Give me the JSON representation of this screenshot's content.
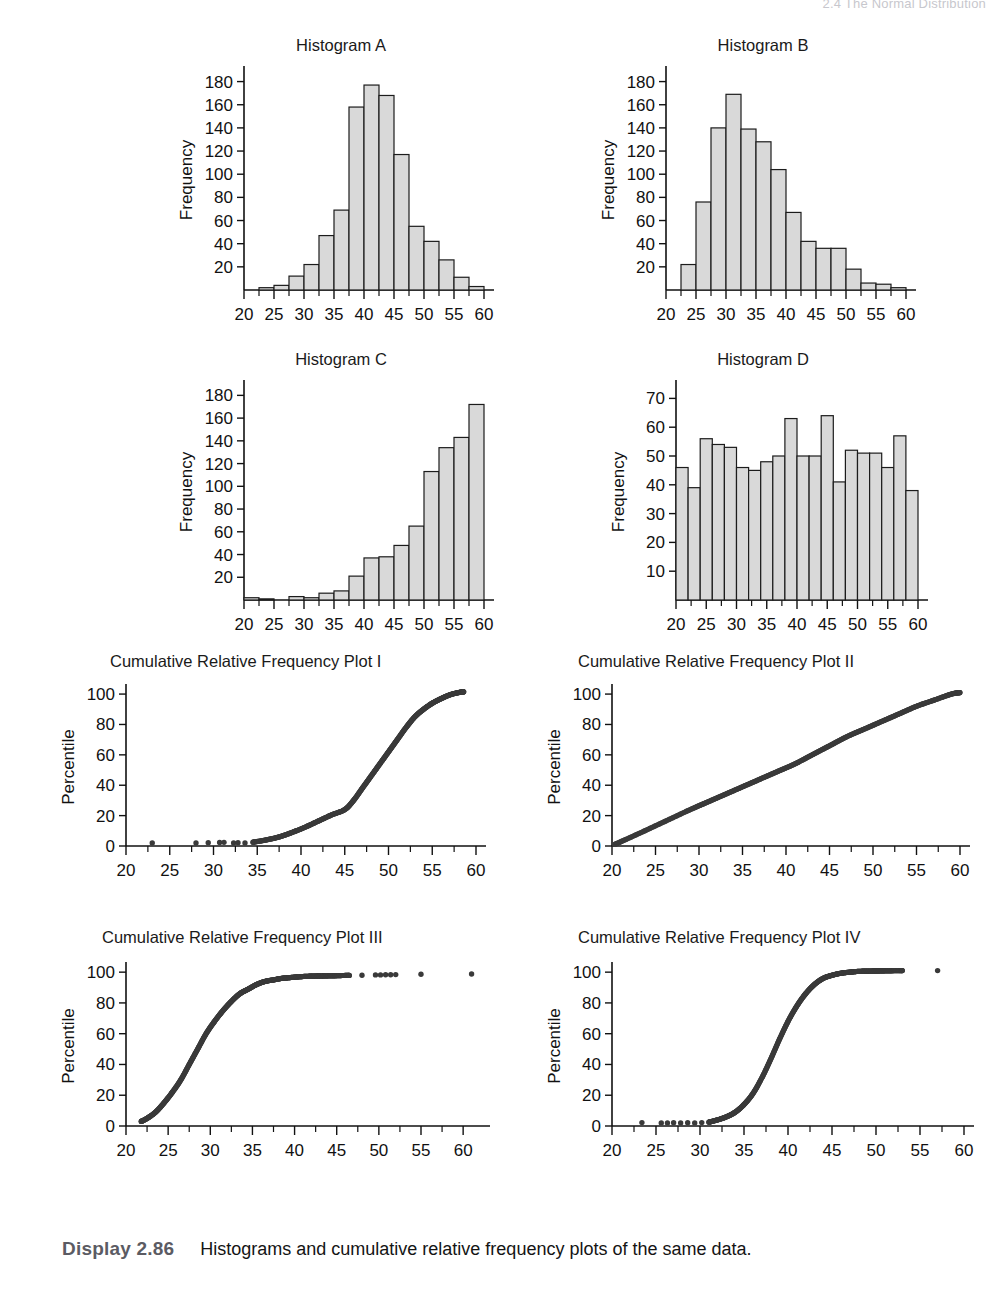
{
  "running_head": "2.4 The Normal Distribution",
  "caption": {
    "display_label": "Display 2.86",
    "text": "Histograms and cumulative relative frequency plots of the same data."
  },
  "panels": [
    {
      "id": "hist-a",
      "title": "Histogram A"
    },
    {
      "id": "hist-b",
      "title": "Histogram B"
    },
    {
      "id": "hist-c",
      "title": "Histogram C"
    },
    {
      "id": "hist-d",
      "title": "Histogram D"
    },
    {
      "id": "crf-i",
      "title": "Cumulative Relative Frequency Plot I"
    },
    {
      "id": "crf-ii",
      "title": "Cumulative Relative Frequency Plot II"
    },
    {
      "id": "crf-iii",
      "title": "Cumulative Relative Frequency Plot III"
    },
    {
      "id": "crf-iv",
      "title": "Cumulative Relative Frequency Plot IV"
    }
  ],
  "axis_titles": {
    "frequency": "Frequency",
    "percentile": "Percentile"
  },
  "chart_data": [
    {
      "id": "hist-a",
      "type": "bar",
      "title": "Histogram A",
      "xlabel": "",
      "ylabel": "Frequency",
      "xlim": [
        20,
        60
      ],
      "ylim": [
        0,
        190
      ],
      "xticks": [
        20,
        25,
        30,
        35,
        40,
        45,
        50,
        55,
        60
      ],
      "xtick_labels": [
        "20",
        "25",
        "30",
        "35",
        "40",
        "45",
        "50",
        "55",
        "60"
      ],
      "minor_xtick_step": 2.5,
      "yticks": [
        20,
        40,
        60,
        80,
        100,
        120,
        140,
        160,
        180
      ],
      "ytick_labels": [
        "20",
        "40",
        "60",
        "80",
        "100",
        "120",
        "140",
        "160",
        "180"
      ],
      "grid": false,
      "bin_width": 2.5,
      "bin_starts": [
        20.0,
        22.5,
        25.0,
        27.5,
        30.0,
        32.5,
        35.0,
        37.5,
        40.0,
        42.5,
        45.0,
        47.5,
        50.0,
        52.5,
        55.0,
        57.5
      ],
      "values": [
        0,
        2,
        4,
        12,
        22,
        47,
        69,
        158,
        177,
        168,
        117,
        55,
        42,
        26,
        11,
        3
      ]
    },
    {
      "id": "hist-b",
      "type": "bar",
      "title": "Histogram B",
      "xlabel": "",
      "ylabel": "Frequency",
      "xlim": [
        20,
        60
      ],
      "ylim": [
        0,
        190
      ],
      "xticks": [
        20,
        25,
        30,
        35,
        40,
        45,
        50,
        55,
        60
      ],
      "xtick_labels": [
        "20",
        "25",
        "30",
        "35",
        "40",
        "45",
        "50",
        "55",
        "60"
      ],
      "minor_xtick_step": 2.5,
      "yticks": [
        20,
        40,
        60,
        80,
        100,
        120,
        140,
        160,
        180
      ],
      "ytick_labels": [
        "20",
        "40",
        "60",
        "80",
        "100",
        "120",
        "140",
        "160",
        "180"
      ],
      "grid": false,
      "bin_width": 2.5,
      "bin_starts": [
        20.0,
        22.5,
        25.0,
        27.5,
        30.0,
        32.5,
        35.0,
        37.5,
        40.0,
        42.5,
        45.0,
        47.5,
        50.0,
        52.5,
        55.0,
        57.5
      ],
      "values": [
        0,
        22,
        76,
        140,
        169,
        139,
        128,
        104,
        67,
        42,
        36,
        36,
        18,
        6,
        5,
        2
      ]
    },
    {
      "id": "hist-c",
      "type": "bar",
      "title": "Histogram C",
      "xlabel": "",
      "ylabel": "Frequency",
      "xlim": [
        20,
        60
      ],
      "ylim": [
        0,
        190
      ],
      "xticks": [
        20,
        25,
        30,
        35,
        40,
        45,
        50,
        55,
        60
      ],
      "xtick_labels": [
        "20",
        "25",
        "30",
        "35",
        "40",
        "45",
        "50",
        "55",
        "60"
      ],
      "minor_xtick_step": 2.5,
      "yticks": [
        20,
        40,
        60,
        80,
        100,
        120,
        140,
        160,
        180
      ],
      "ytick_labels": [
        "20",
        "40",
        "60",
        "80",
        "100",
        "120",
        "140",
        "160",
        "180"
      ],
      "grid": false,
      "bin_width": 2.5,
      "bin_starts": [
        20.0,
        22.5,
        25.0,
        27.5,
        30.0,
        32.5,
        35.0,
        37.5,
        40.0,
        42.5,
        45.0,
        47.5,
        50.0,
        52.5,
        55.0,
        57.5
      ],
      "values": [
        2,
        1,
        0,
        3,
        2,
        6,
        8,
        21,
        37,
        38,
        48,
        65,
        113,
        134,
        143,
        172
      ]
    },
    {
      "id": "hist-d",
      "type": "bar",
      "title": "Histogram D",
      "xlabel": "",
      "ylabel": "Frequency",
      "xlim": [
        20,
        60
      ],
      "ylim": [
        0,
        75
      ],
      "xticks": [
        20,
        25,
        30,
        35,
        40,
        45,
        50,
        55,
        60
      ],
      "xtick_labels": [
        "20",
        "25",
        "30",
        "35",
        "40",
        "45",
        "50",
        "55",
        "60"
      ],
      "minor_xtick_step": 2.5,
      "yticks": [
        10,
        20,
        30,
        40,
        50,
        60,
        70
      ],
      "ytick_labels": [
        "10",
        "20",
        "30",
        "40",
        "50",
        "60",
        "70"
      ],
      "grid": false,
      "bin_width": 2.0,
      "bin_starts": [
        20,
        22,
        24,
        26,
        28,
        30,
        32,
        34,
        36,
        38,
        40,
        42,
        44,
        46,
        48,
        50,
        52,
        54,
        56,
        58
      ],
      "values": [
        46,
        39,
        56,
        54,
        53,
        46,
        45,
        48,
        50,
        63,
        50,
        50,
        64,
        41,
        52,
        51,
        51,
        46,
        57,
        38
      ]
    },
    {
      "id": "crf-i",
      "type": "scatter",
      "title": "Cumulative Relative Frequency Plot I",
      "xlabel": "",
      "ylabel": "Percentile",
      "xlim": [
        20,
        60
      ],
      "ylim": [
        0,
        104
      ],
      "xticks": [
        20,
        25,
        30,
        35,
        40,
        45,
        50,
        55,
        60
      ],
      "xtick_labels": [
        "20",
        "25",
        "30",
        "35",
        "40",
        "45",
        "50",
        "55",
        "60"
      ],
      "minor_xtick_step": 2.5,
      "yticks": [
        0,
        20,
        40,
        60,
        80,
        100
      ],
      "ytick_labels": [
        "0",
        "20",
        "40",
        "60",
        "80",
        "100"
      ],
      "grid": false,
      "shape": "ogive-left-skewed",
      "note": "Matches Histogram C (left-skewed): isolated low-percentile points near 23, 28, 30, 31-33, then rise from ~35 to 100 near 58.",
      "outlier_x": [
        23.0,
        28.0,
        29.4,
        30.7,
        31.2,
        32.3,
        32.8,
        33.6
      ],
      "outlier_y": [
        2.0,
        2.0,
        2.2,
        2.3,
        2.4,
        2.0,
        2.2,
        2.0
      ],
      "curve_x": [
        34.5,
        36,
        37.5,
        39,
        40.5,
        42,
        43.5,
        45,
        46,
        47,
        48,
        49,
        50,
        51,
        52,
        53,
        54,
        55,
        56,
        57,
        58,
        58.6
      ],
      "curve_y": [
        2.5,
        4,
        6,
        9,
        12.5,
        16.5,
        20.5,
        24,
        30,
        38,
        46,
        54,
        62,
        70,
        78,
        85,
        90,
        94,
        97,
        99.5,
        101,
        101.5
      ]
    },
    {
      "id": "crf-ii",
      "type": "scatter",
      "title": "Cumulative Relative Frequency Plot II",
      "xlabel": "",
      "ylabel": "Percentile",
      "xlim": [
        20,
        60
      ],
      "ylim": [
        0,
        104
      ],
      "xticks": [
        20,
        25,
        30,
        35,
        40,
        45,
        50,
        55,
        60
      ],
      "xtick_labels": [
        "20",
        "25",
        "30",
        "35",
        "40",
        "45",
        "50",
        "55",
        "60"
      ],
      "minor_xtick_step": 2.5,
      "yticks": [
        0,
        20,
        40,
        60,
        80,
        100
      ],
      "ytick_labels": [
        "0",
        "20",
        "40",
        "60",
        "80",
        "100"
      ],
      "grid": false,
      "shape": "linear",
      "note": "Matches Histogram D (uniform): nearly straight line from (20.3, 1) to (60, 101).",
      "curve_x": [
        20.3,
        23,
        26,
        29,
        31,
        33,
        35,
        37,
        39,
        41,
        43,
        45,
        47,
        49,
        51,
        53,
        55,
        57,
        59,
        60
      ],
      "curve_y": [
        1,
        8,
        16,
        24,
        29,
        34,
        39,
        44,
        49,
        54,
        60,
        66,
        72,
        77,
        82,
        87,
        92,
        96,
        100,
        101
      ]
    },
    {
      "id": "crf-iii",
      "type": "scatter",
      "title": "Cumulative Relative Frequency Plot III",
      "xlabel": "",
      "ylabel": "Percentile",
      "xlim": [
        20,
        62
      ],
      "ylim": [
        0,
        104
      ],
      "xticks": [
        20,
        25,
        30,
        35,
        40,
        45,
        50,
        55,
        60
      ],
      "xtick_labels": [
        "20",
        "25",
        "30",
        "35",
        "40",
        "45",
        "50",
        "55",
        "60"
      ],
      "minor_xtick_step": 2.5,
      "yticks": [
        0,
        20,
        40,
        60,
        80,
        100
      ],
      "ytick_labels": [
        "0",
        "20",
        "40",
        "60",
        "80",
        "100"
      ],
      "grid": false,
      "shape": "ogive-right-skewed",
      "note": "Matches Histogram B (right-skewed): rapid rise from ~22 to ~40, plateau near 97-99, scattered high-end points out to 61.",
      "curve_x": [
        21.8,
        22.5,
        23.5,
        24.5,
        25.5,
        26.5,
        27.5,
        28.5,
        29.5,
        30.5,
        31.5,
        32.5,
        33.5,
        34.5,
        35.5,
        36.5,
        37.5,
        38.5,
        39.5,
        40.5,
        41.5,
        42.5,
        43.5,
        44.5,
        45.5,
        46.5
      ],
      "curve_y": [
        3,
        5,
        9,
        15,
        22,
        30,
        40,
        50,
        60,
        68,
        75,
        81,
        86,
        89,
        92,
        94,
        95,
        96,
        96.5,
        97,
        97.3,
        97.5,
        97.6,
        97.7,
        97.8,
        97.9
      ],
      "outlier_x": [
        48.0,
        49.6,
        50.2,
        50.8,
        51.4,
        52.0,
        55.0,
        61.0
      ],
      "outlier_y": [
        98.0,
        98.2,
        98.2,
        98.3,
        98.3,
        98.4,
        98.6,
        98.8
      ]
    },
    {
      "id": "crf-iv",
      "type": "scatter",
      "title": "Cumulative Relative Frequency Plot IV",
      "xlabel": "",
      "ylabel": "Percentile",
      "xlim": [
        20,
        60
      ],
      "ylim": [
        0,
        104
      ],
      "xticks": [
        20,
        25,
        30,
        35,
        40,
        45,
        50,
        55,
        60
      ],
      "xtick_labels": [
        "20",
        "25",
        "30",
        "35",
        "40",
        "45",
        "50",
        "55",
        "60"
      ],
      "minor_xtick_step": 2.5,
      "yticks": [
        0,
        20,
        40,
        60,
        80,
        100
      ],
      "ytick_labels": [
        "0",
        "20",
        "40",
        "60",
        "80",
        "100"
      ],
      "grid": false,
      "shape": "ogive-symmetric",
      "note": "Matches Histogram A (symmetric): low points near 23-30, S-rise centered ~40, plateau at 100 from ~48, lone point near 57.",
      "outlier_x": [
        23.4,
        25.6,
        26.3,
        27.0,
        27.8,
        28.6,
        29.4,
        30.2
      ],
      "outlier_y": [
        2.2,
        2.0,
        2.0,
        2.1,
        2.0,
        2.1,
        2.0,
        2.2
      ],
      "curve_x": [
        31,
        32,
        33,
        34,
        35,
        36,
        37,
        38,
        39,
        40,
        41,
        42,
        43,
        44,
        45,
        46,
        47,
        48,
        49,
        50,
        51,
        52,
        53
      ],
      "curve_y": [
        2.5,
        4,
        6,
        9,
        14,
        21,
        31,
        43,
        56,
        68,
        78,
        86,
        92,
        96,
        98,
        99.3,
        100,
        100.5,
        100.7,
        100.8,
        100.9,
        101,
        101
      ],
      "far_outlier_x": [
        57.0
      ],
      "far_outlier_y": [
        101.0
      ]
    }
  ]
}
